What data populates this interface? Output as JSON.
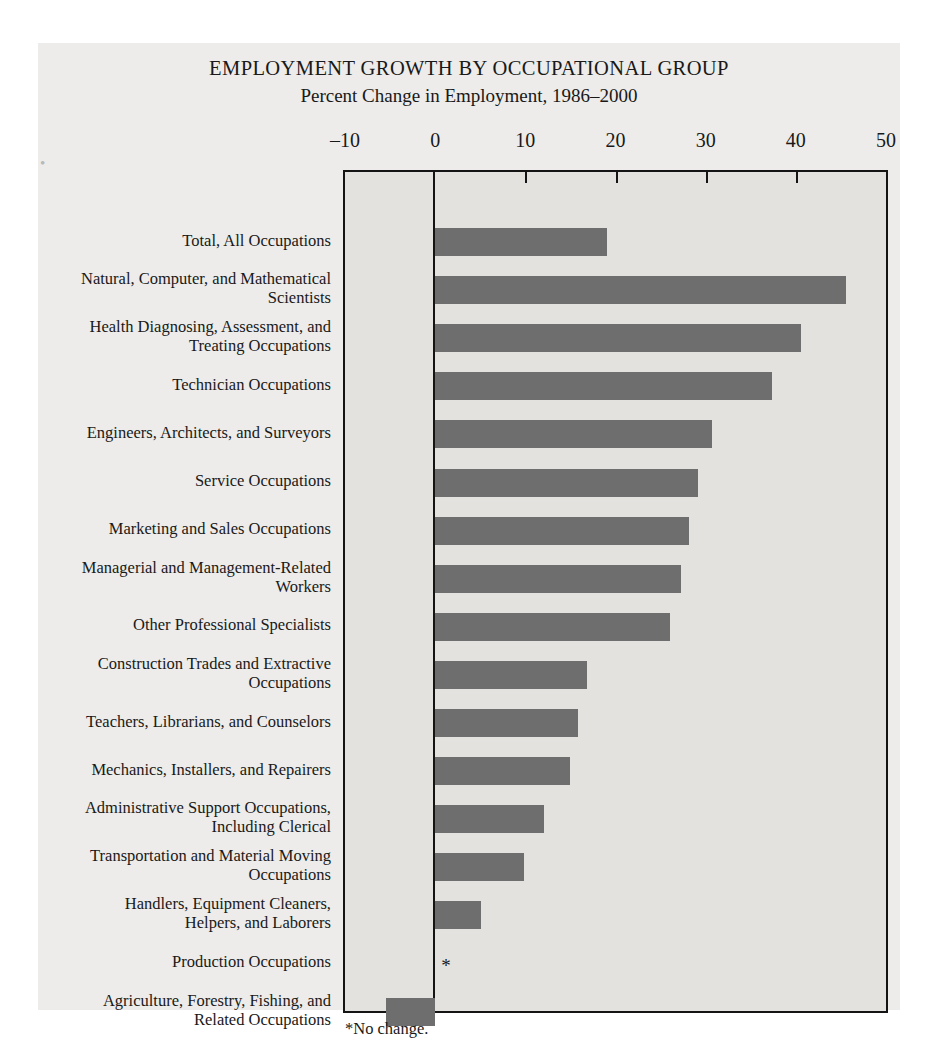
{
  "chart_data": {
    "type": "bar",
    "orientation": "horizontal",
    "title": "EMPLOYMENT GROWTH BY OCCUPATIONAL GROUP",
    "subtitle": "Percent Change in Employment, 1986–2000",
    "xlabel": "",
    "ylabel": "",
    "xlim": [
      -10,
      50
    ],
    "xticks": [
      -10,
      0,
      10,
      20,
      30,
      40,
      50
    ],
    "xtick_labels": [
      "–10",
      "0",
      "10",
      "20",
      "30",
      "40",
      "50"
    ],
    "grid": false,
    "legend": null,
    "footnote": "*No change.",
    "bar_color": "#6e6e6e",
    "plot_background": "#e3e2df",
    "page_background": "#edecea",
    "axis_color": "#141414",
    "categories": [
      "Total, All Occupations",
      "Natural, Computer, and Mathematical Scientists",
      "Health Diagnosing, Assessment, and Treating Occupations",
      "Technician Occupations",
      "Engineers, Architects, and Surveyors",
      "Service Occupations",
      "Marketing and Sales Occupations",
      "Managerial and Management-Related Workers",
      "Other Professional Specialists",
      "Construction Trades and Extractive Occupations",
      "Teachers, Librarians, and Counselors",
      "Mechanics, Installers, and Repairers",
      "Administrative Support Occupations, Including Clerical",
      "Transportation and Material Moving Occupations",
      "Handlers, Equipment Cleaners, Helpers, and Laborers",
      "Production Occupations",
      "Agriculture, Forestry, Fishing, and Related Occupations"
    ],
    "values": [
      19.1,
      45.6,
      40.6,
      37.4,
      30.7,
      29.1,
      28.2,
      27.3,
      26.0,
      16.8,
      15.8,
      15.0,
      12.1,
      9.9,
      5.1,
      0,
      -5.5
    ],
    "value_annotations": [
      "",
      "",
      "",
      "",
      "",
      "",
      "",
      "",
      "",
      "",
      "",
      "",
      "",
      "",
      "",
      "*",
      ""
    ]
  },
  "labels": {
    "lines": [
      [
        "Total, All Occupations"
      ],
      [
        "Natural, Computer, and Mathematical",
        "Scientists"
      ],
      [
        "Health Diagnosing, Assessment, and",
        "Treating Occupations"
      ],
      [
        "Technician Occupations"
      ],
      [
        "Engineers, Architects, and Surveyors"
      ],
      [
        "Service Occupations"
      ],
      [
        "Marketing and Sales Occupations"
      ],
      [
        "Managerial and Management-Related",
        "Workers"
      ],
      [
        "Other Professional Specialists"
      ],
      [
        "Construction Trades and Extractive",
        "Occupations"
      ],
      [
        "Teachers, Librarians, and Counselors"
      ],
      [
        "Mechanics, Installers, and Repairers"
      ],
      [
        "Administrative Support Occupations,",
        "Including Clerical"
      ],
      [
        "Transportation and Material Moving",
        "Occupations"
      ],
      [
        "Handlers, Equipment Cleaners,",
        "Helpers, and Laborers"
      ],
      [
        "Production Occupations"
      ],
      [
        "Agriculture, Forestry, Fishing, and",
        "Related Occupations"
      ]
    ]
  },
  "page": {
    "edge_mark": "•"
  }
}
